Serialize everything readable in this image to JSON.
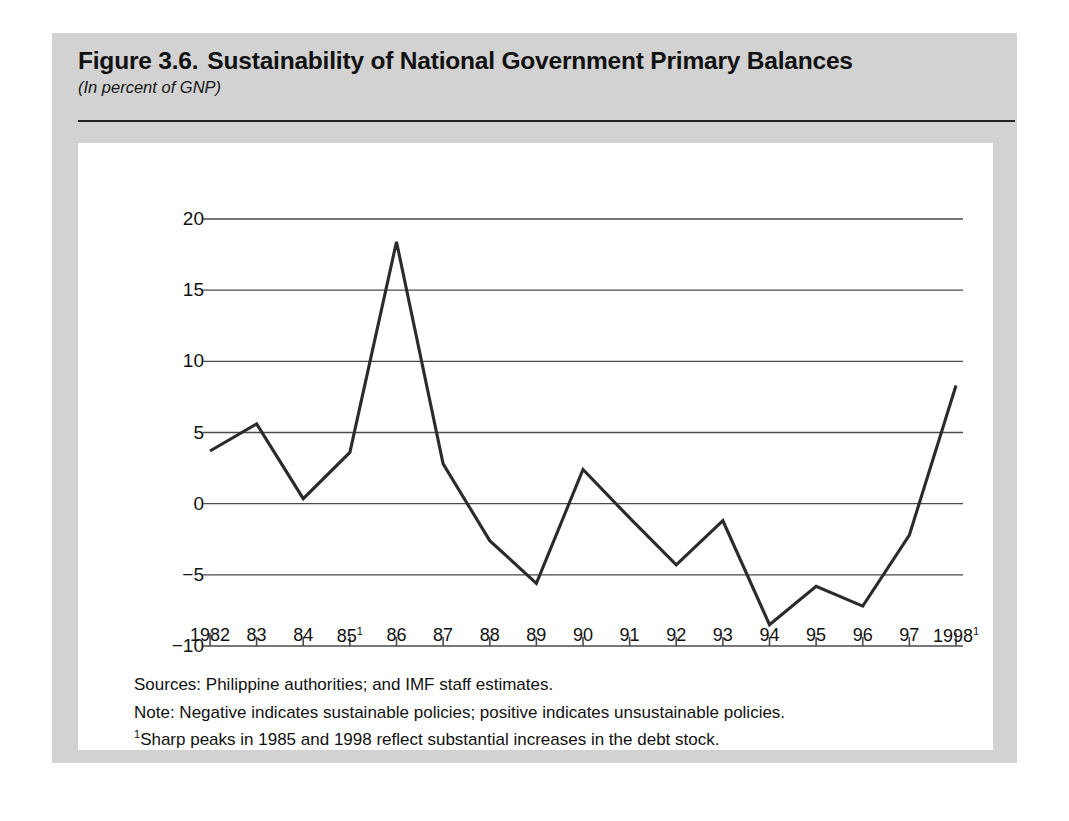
{
  "figure": {
    "number": "Figure 3.6.",
    "title": "Sustainability of National Government Primary Balances",
    "subtitle": "(In percent of GNP)"
  },
  "footnotes": {
    "sources": "Sources:  Philippine authorities; and IMF staff estimates.",
    "note": "Note:  Negative indicates sustainable policies; positive indicates unsustainable policies.",
    "footnote_marker": "1",
    "footnote_text": "Sharp peaks in 1985 and 1998 reflect substantial increases in the debt stock."
  },
  "chart_data": {
    "type": "line",
    "title": "Sustainability of National Government Primary Balances",
    "subtitle": "(In percent of GNP)",
    "xlabel": "",
    "ylabel": "",
    "ylim": [
      -10,
      20
    ],
    "yticks": [
      20,
      15,
      10,
      5,
      0,
      -5,
      -10
    ],
    "ytick_labels": [
      "20",
      "15",
      "10",
      "5",
      "0",
      "−5",
      "−10"
    ],
    "grid": true,
    "legend": "none",
    "categories": [
      "1982",
      "83",
      "84",
      "85",
      "86",
      "87",
      "88",
      "89",
      "90",
      "91",
      "92",
      "93",
      "94",
      "95",
      "96",
      "97",
      "1998"
    ],
    "xtick_labels": [
      "1982",
      "83",
      "84",
      "85¹",
      "86",
      "87",
      "88",
      "89",
      "90",
      "91",
      "92",
      "93",
      "94",
      "95",
      "96",
      "97",
      "1998¹"
    ],
    "xtick_footnote_indices": [
      3,
      16
    ],
    "values": [
      3.7,
      5.6,
      0.35,
      3.6,
      18.4,
      2.8,
      -2.6,
      -5.6,
      2.4,
      -1.0,
      -4.3,
      -1.2,
      -8.5,
      -5.8,
      -7.2,
      -2.2,
      8.3
    ],
    "series": [
      {
        "name": "Primary balance sustainability indicator",
        "color": "#2b2b2b",
        "values": [
          3.7,
          5.6,
          0.35,
          3.6,
          18.4,
          2.8,
          -2.6,
          -5.6,
          2.4,
          -1.0,
          -4.3,
          -1.2,
          -8.5,
          -5.8,
          -7.2,
          -2.2,
          8.3
        ]
      }
    ]
  },
  "colors": {
    "panel_background": "#d2d2d2",
    "plot_background": "#ffffff",
    "line": "#2b2b2b",
    "grid": "#4a4a4a",
    "text": "#111111"
  }
}
